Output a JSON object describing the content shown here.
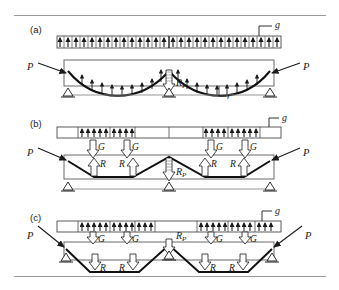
{
  "figure": {
    "panels": [
      {
        "id": "a",
        "label": "(a)",
        "tendon_profile": "parabolic-continuous",
        "labels": {
          "load_strip": "g",
          "prestress_left": "P",
          "prestress_right": "P",
          "center_reaction": "R",
          "center_reaction_sub": "P",
          "radius": "r"
        }
      },
      {
        "id": "b",
        "label": "(b)",
        "tendon_profile": "trapezoidal-draped",
        "labels": {
          "load_strip": "g",
          "prestress_left": "P",
          "prestress_right": "P",
          "center_reaction": "R",
          "center_reaction_sub": "P",
          "point_loads": [
            "G",
            "G",
            "G",
            "G"
          ],
          "reactions": [
            "R",
            "R",
            "R",
            "R"
          ]
        }
      },
      {
        "id": "c",
        "label": "(c)",
        "tendon_profile": "trapezoidal-deep",
        "labels": {
          "load_strip": "g",
          "prestress_left": "P",
          "prestress_right": "P",
          "center_reaction": "R",
          "center_reaction_sub": "P",
          "point_loads": [
            "G",
            "G",
            "G",
            "G"
          ],
          "reactions": [
            "R",
            "R",
            "R",
            "R"
          ]
        }
      }
    ],
    "colors": {
      "ink": "#1a1a1a",
      "rule": "#9a9a9a",
      "beam_outline": "#5a5a5a",
      "tendon": "#111111"
    }
  }
}
